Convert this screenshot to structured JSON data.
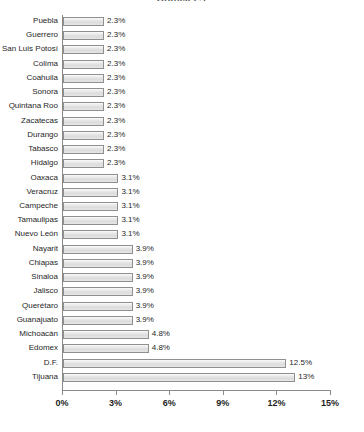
{
  "chart_data": {
    "type": "bar",
    "orientation": "horizontal",
    "title": "Gráfica 2.1",
    "xlabel": "",
    "ylabel": "",
    "xlim": [
      0,
      15
    ],
    "xticks": [
      "0%",
      "3%",
      "6%",
      "9%",
      "12%",
      "15%"
    ],
    "xtick_values": [
      0,
      3,
      6,
      9,
      12,
      15
    ],
    "grid": false,
    "legend": false,
    "value_suffix": "%",
    "bar_fill": "#e4e4e4",
    "bar_border": "#8f8f8f",
    "axis_color": "#8a8a8a",
    "categories": [
      "Puebla",
      "Guerrero",
      "San Luis Potosí",
      "Colima",
      "Coahuila",
      "Sonora",
      "Quintana Roo",
      "Zacatecas",
      "Durango",
      "Tabasco",
      "Hidalgo",
      "Oaxaca",
      "Veracruz",
      "Campeche",
      "Tamaulipas",
      "Nuevo León",
      "Nayarit",
      "Chiapas",
      "Sinaloa",
      "Jalisco",
      "Querétaro",
      "Guanajuato",
      "Michoacán",
      "Edomex",
      "D.F.",
      "Tijuana"
    ],
    "values": [
      2.3,
      2.3,
      2.3,
      2.3,
      2.3,
      2.3,
      2.3,
      2.3,
      2.3,
      2.3,
      2.3,
      3.1,
      3.1,
      3.1,
      3.1,
      3.1,
      3.9,
      3.9,
      3.9,
      3.9,
      3.9,
      3.9,
      4.8,
      4.8,
      12.5,
      13
    ],
    "value_labels": [
      "2.3%",
      "2.3%",
      "2.3%",
      "2.3%",
      "2.3%",
      "2.3%",
      "2.3%",
      "2.3%",
      "2.3%",
      "2.3%",
      "2.3%",
      "3.1%",
      "3.1%",
      "3.1%",
      "3.1%",
      "3.1%",
      "3.9%",
      "3.9%",
      "3.9%",
      "3.9%",
      "3.9%",
      "3.9%",
      "4.8%",
      "4.8%",
      "12.5%",
      "13%"
    ]
  }
}
